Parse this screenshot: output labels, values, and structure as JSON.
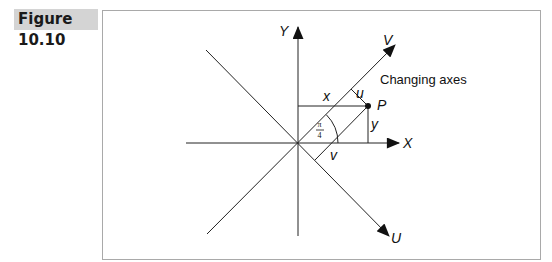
{
  "figure": {
    "label": "Figure 10.10",
    "caption": "Changing axes",
    "axis_labels": {
      "x": "X",
      "y": "Y",
      "u": "U",
      "v": "V"
    },
    "point_label": "P",
    "segment_labels": {
      "x": "x",
      "y": "y",
      "u": "u",
      "v": "v"
    },
    "angle_label": {
      "numerator": "π",
      "denominator": "4"
    }
  }
}
